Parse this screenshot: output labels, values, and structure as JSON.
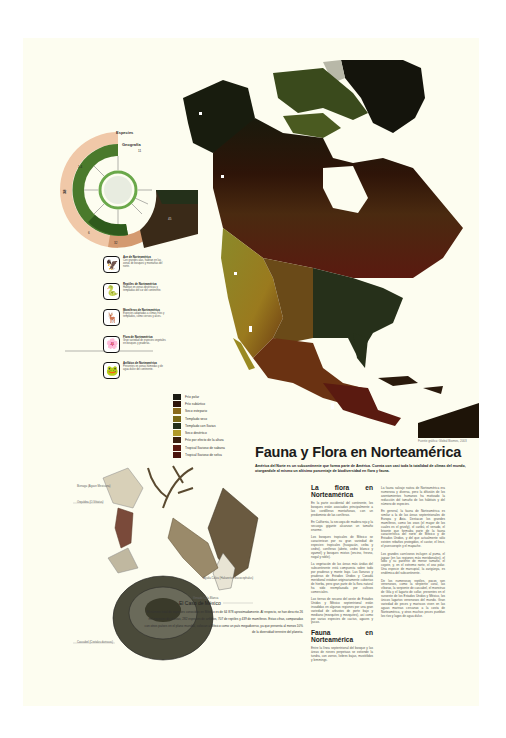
{
  "poster": {
    "title": "Fauna y Flora en Norteamérica",
    "intro": "América del Norte es un subcontinente que forma parte de América. Cuenta con casi toda la totalidad de climas del mundo, otorgandole al mismo un altisimo porcentaje de biodiversidad en flora y fauna.",
    "map_credit": "Fuente gráfica: Global Biomes, 2003",
    "colors": {
      "background": "#fdfdf0",
      "map_dark": "#1a1208",
      "map_brown": "#3d1a0c",
      "map_olive": "#6b6a1c",
      "map_yellow": "#9a8a22",
      "map_red": "#6a1c10"
    }
  },
  "wheel": {
    "label_outer": "Especies",
    "label_inner": "Geografía",
    "segment_labels": [
      "38",
      "1.4",
      "32",
      "6",
      "11",
      "45"
    ]
  },
  "species": [
    {
      "icon": "eagle-icon",
      "glyph": "🦅",
      "title": "Ave de Norteamérica",
      "text": "Con grandes alas, habitan en las zonas de bosques y montañas del norte."
    },
    {
      "icon": "snake-icon",
      "glyph": "🐍",
      "title": "Reptiles de Norteamérica",
      "text": "Habitan en zonas desérticas y templadas del sur del continente."
    },
    {
      "icon": "deer-icon",
      "glyph": "🦌",
      "title": "Mamíferos de Norteamérica",
      "text": "Especies adaptadas a climas fríos y templados, como ciervos y alces."
    },
    {
      "icon": "flower-icon",
      "glyph": "🌸",
      "title": "Flora de Norteamérica",
      "text": "Gran variedad de especies vegetales en bosques y praderas."
    },
    {
      "icon": "frog-icon",
      "glyph": "🐸",
      "title": "Anfibios de Norteamérica",
      "text": "Presentes en zonas húmedas y de agua dulce del continente."
    }
  ],
  "legend": [
    {
      "label": "Frío polar",
      "color": "#1c1c14"
    },
    {
      "label": "Frío subártico",
      "color": "#2e1408"
    },
    {
      "label": "Seco estepario",
      "color": "#8a6a1a"
    },
    {
      "label": "Templado seco",
      "color": "#7a6a16"
    },
    {
      "label": "Templado con lluvias",
      "color": "#24301a"
    },
    {
      "label": "Seco desértico",
      "color": "#b09a2a"
    },
    {
      "label": "Frío por efecto de la altura",
      "color": "#3a2010"
    },
    {
      "label": "Tropical lluvioso de sabana",
      "color": "#5a1a10"
    },
    {
      "label": "Tropical lluvioso de selva",
      "color": "#4a140c"
    }
  ],
  "flora": {
    "heading": "La flora en Norteamérica",
    "paragraphs": [
      "En la parte occidental del continente, los bosques están asociados principalmente a las cordilleras montañosas, con un predominio de las coníferas.",
      "En California, la secuoya de madera roja y la secuoya gigante alcanzan un tamaño enorme.",
      "Los bosques tropicales de México se caracterizan por su gran variedad de especies: tropicales (huayacán, ceiba y cedro), coníferas (abeto, cedro blanco y oyamel) y bosques mixtos (encino, fresno, nogal y roble).",
      "La vegetación de las áreas más áridas del subcontinente está compuesta sobre todo por praderas y monte bajo. Las llanuras y praderas de Estados Unidos y Canadá meridional estaban originariamente cubiertas de hierba, pero gran parte de la flora natural ha sido reemplazada por cultivos comerciales.",
      "Las tierras de secano del oeste de Estados Unidos y México septentrional están invadidas en algunas regiones por una gran variedad de arbustos de porte bajo y mediano (mezquites y mezquites), así como por varias especies de cactus, agaves y yucas."
    ]
  },
  "fauna": {
    "heading": "Fauna en Norteamérica",
    "paragraphs": [
      "Entre la línea septentrional del bosque y las áreas de nieves perpetuas se extiende la tundra, con zorros, liebres bajas, mustélidos y lemmings."
    ]
  },
  "fauna_right": {
    "paragraphs": [
      "La fauna salvaje nativa de Norteamérica era numerosa y diversa, pero la difusión de los asentamientos humanos ha motivado la reducción del tamaño de los hábitats y del número de especies.",
      "En general, la fauna de Norteamérica es similar a la de las áreas septentrionales de Europa y Asia. Destacan los grandes mamíferos, como los osos (el mayor de los cuales es el grizzly), el caribú, el venado, el bisonte que formaba parte de la fauna característica del norte de México y de Estados Unidos, y del que actualmente sólo existen rebaños protegidos, el castor, el lince, el puercoespín y el mapache.",
      "Los grandes carnívoros incluyen al puma, el jaguar (en las regiones más meridionales), el lobo y su pariente de menor tamaño, el coyote, y, en el extremo norte, el oso polar. Una especie de marsupial, la zarigüeya, es endémica del subcontinente.",
      "De los numerosos reptiles, pocos son venenosos, como la serpiente coral, las víboras, la serpiente de cascabel, el monstruo de Gila y el lagarto de collar, presentes en el suroeste de los Estados Unidos y México, los únicos lagartos venenosos del mundo. Gran variedad de peces y mariscos viven en las aguas marinas cercanas a la costa de Norteamérica, y otros muchos peces pueblan los ríos y lagos de agua dulce."
    ]
  },
  "mexico_case": {
    "heading": "El Caso de México",
    "text": "El número total de especies conocidas en México es de 64 878 aproximadamente. Al respecto, se han descrito 26 mil especies de plantas, 282 especies de anfibios, 707 de reptiles y 439 de mamíferos. Estas cifras, comparadas con otros países en el plano mundial, colocan a México como un país megadiverso, ya que presenta al menos 10% de la diversidad terrestre del planeta."
  },
  "illustration_labels": {
    "flower_1": "Biznaga (Agave Mexicana)",
    "flower_2": "Orquídea (O.Vittatus)",
    "snake": "Cascabel (Crotalus durissus)",
    "deer": "Venado Cola Blanca",
    "eagle": "Águila Calva (Haliaeetus leucocephalus)"
  }
}
